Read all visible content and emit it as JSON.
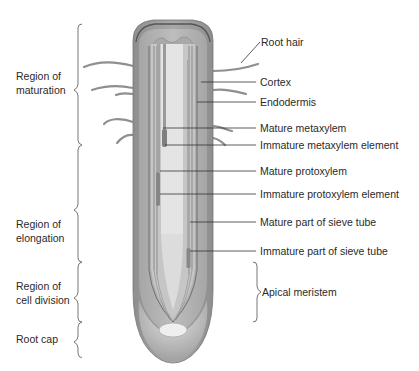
{
  "regions": [
    {
      "label_line1": "Region of",
      "label_line2": "maturation"
    },
    {
      "label_line1": "Region of",
      "label_line2": "elongation"
    },
    {
      "label_line1": "Region of",
      "label_line2": "cell division"
    },
    {
      "label_line1": "Root cap",
      "label_line2": ""
    }
  ],
  "labels": [
    {
      "text": "Root hair"
    },
    {
      "text": "Cortex"
    },
    {
      "text": "Endodermis"
    },
    {
      "text": "Mature metaxylem"
    },
    {
      "text": "Immature metaxylem element"
    },
    {
      "text": "Mature protoxylem"
    },
    {
      "text": "Immature protoxylem element"
    },
    {
      "text": "Mature part of sieve tube"
    },
    {
      "text": "Immature part of sieve tube"
    },
    {
      "text": "Apical meristem"
    }
  ],
  "colors": {
    "epidermis": "#9a9a9a",
    "cortex": "#b8b8b8",
    "stele": "#c9c9c9",
    "pith": "#e2e2e2",
    "xylem": "#8a8a8a",
    "root_cap": "#cfcfcf",
    "leader_line": "#333333",
    "bracket": "#555555"
  }
}
